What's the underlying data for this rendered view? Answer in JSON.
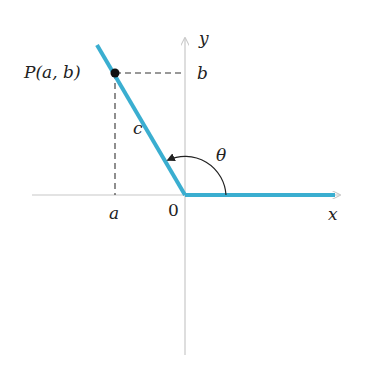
{
  "diagram": {
    "colors": {
      "ray": "#3aaed0",
      "axis": "#c8c8c8",
      "dashed": "#333333",
      "point": "#111111",
      "text": "#222222"
    },
    "labels": {
      "point": "P(a, b)",
      "b": "b",
      "y_axis": "y",
      "x_axis": "x",
      "c": "c",
      "theta": "θ",
      "a": "a",
      "origin": "0"
    },
    "geometry": {
      "origin": [
        185,
        195
      ],
      "point_P": [
        115,
        73
      ],
      "terminal_ray_end": [
        97,
        45
      ],
      "initial_ray_end": [
        335,
        195
      ],
      "x_axis_range": [
        32,
        340
      ],
      "y_axis_range": [
        38,
        355
      ]
    }
  }
}
